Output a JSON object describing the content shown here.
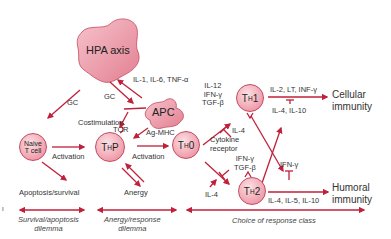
{
  "colors": {
    "arrow": "#c0203a",
    "node_fill": "#ef9aa8",
    "node_border": "#c44a60",
    "text": "#333333"
  },
  "nodes": {
    "hpa": "HPA axis",
    "apc": "APC",
    "naive": "Naive\nT cell",
    "thp_main": "T",
    "thp_sub": "H",
    "thp_suffix": "P",
    "th0_main": "T",
    "th0_sub": "H",
    "th0_suffix": "0",
    "th1_main": "T",
    "th1_sub": "H",
    "th1_suffix": "1",
    "th2_main": "T",
    "th2_sub": "H",
    "th2_suffix": "2"
  },
  "labels": {
    "il_cytokines": "IL-1, IL-6, TNF-α",
    "gc_left": "GC",
    "gc_mid": "GC",
    "costimulation": "Costimulation",
    "tcr": "TCR",
    "ag_mhc": "Ag-MHC",
    "activation_1": "Activation",
    "activation_2": "Activation",
    "apoptosis_survival": "Apoptosis/survival",
    "anergy": "Anergy",
    "th1_inducers": "IL-12\nIFN-γ\nTGF-β",
    "il4_inhibit_th1": "IL-4",
    "cytokine_receptor": "Cytokine\nreceptor",
    "th2_inhibitors": "IFN-γ\nTGF-β",
    "il4_th2": "IL-4",
    "th1_outputs": "IL-2, LT, INF-γ",
    "th1_inhibitors": "IL-4, IL-10",
    "ifn_gamma_th2": "IFN-γ",
    "th2_outputs": "IL-4, IL-5, IL-10",
    "cellular_immunity": "Cellular\nimmunity",
    "humoral_immunity": "Humoral\nimmunity"
  },
  "dilemmas": {
    "survival": "Survival/apoptosis\ndilemma",
    "anergy": "Anergy/response\ndilemma",
    "choice": "Choice of response class"
  },
  "margin_mark": "I"
}
